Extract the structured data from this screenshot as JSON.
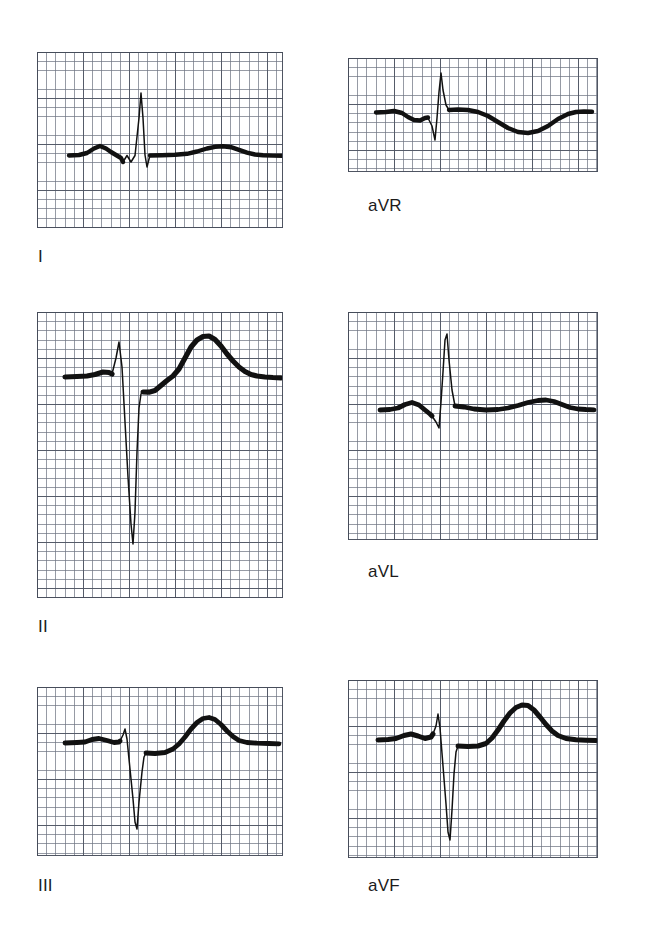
{
  "figure": {
    "kind": "ecg-limb-leads",
    "background_color": "#ffffff",
    "trace_color": "#111111",
    "grid_fine_color": "#6e7482",
    "grid_bold_color": "#505664",
    "width": 667,
    "height": 941
  },
  "panels": [
    {
      "id": "lead-i",
      "label": "I",
      "label_left": 38,
      "label_top": 247,
      "x": 37,
      "y": 52,
      "w": 246,
      "h": 176,
      "baseline_frac": 0.585,
      "grid_mm": 9.2,
      "description": "Lead I: small upright P, narrow tall R wave, small s, low flat ST, broad low T wave"
    },
    {
      "id": "lead-avr",
      "label": "aVR",
      "label_left": 368,
      "label_top": 196,
      "x": 348,
      "y": 58,
      "w": 250,
      "h": 114,
      "baseline_frac": 0.5,
      "grid_mm": 9.2,
      "description": "aVR: notched low P, deep narrow Q/S, tall R spike, broad inverted T wave"
    },
    {
      "id": "lead-ii",
      "label": "II",
      "label_left": 38,
      "label_top": 617,
      "x": 37,
      "y": 312,
      "w": 246,
      "h": 286,
      "baseline_frac": 0.228,
      "grid_mm": 9.2,
      "description": "Lead II: tall peaked P/R, very deep narrow S wave, large broad upright T wave"
    },
    {
      "id": "lead-avl",
      "label": "aVL",
      "label_left": 368,
      "label_top": 562,
      "x": 348,
      "y": 312,
      "w": 250,
      "h": 228,
      "baseline_frac": 0.425,
      "grid_mm": 9.2,
      "description": "aVL: rounded P, small s, tall narrow R spike, flat ST, low broad T wave"
    },
    {
      "id": "lead-iii",
      "label": "III",
      "label_left": 38,
      "label_top": 876,
      "x": 37,
      "y": 687,
      "w": 246,
      "h": 169,
      "baseline_frac": 0.33,
      "grid_mm": 9.2,
      "description": "Lead III: low P, small r spike, deep narrow S wave, broad upright T wave"
    },
    {
      "id": "lead-avf",
      "label": "aVF",
      "label_left": 368,
      "label_top": 876,
      "x": 348,
      "y": 680,
      "w": 250,
      "h": 178,
      "baseline_frac": 0.305,
      "grid_mm": 9.2,
      "description": "aVF: low rounded P, small r, very deep narrow S wave, large broad upright T wave"
    }
  ],
  "waveforms": {
    "lead-i": {
      "viewbox": "0 0 246 176",
      "baseline_y": 103,
      "thin_path": "M 86 110 L 90 103.5 L 94 110 L 98 103.5 L 102 66 L 104 41 L 106 66 L 108 103 L 110 115 L 113 103",
      "thick_path": "M 32 103.5 L 42 103 L 50 101 L 57 96.5 L 63 94 L 69 96.5 L 74 100 L 79 103 L 84 106 L 86 110 M 113 103.5 L 125 103.2 L 138 102.8 L 150 101.8 L 160 99.5 L 170 96.5 L 178 94.8 L 186 94.2 L 194 95.2 L 202 97.8 L 210 100.6 L 218 102.5 L 226 103.3 L 236 103.6 L 245 103.8",
      "thin_width": 1.5,
      "thick_width": 4.4
    },
    "lead-avr": {
      "viewbox": "0 0 250 114",
      "baseline_y": 56,
      "thin_path": "M 80 60 L 84 68 L 87 82 L 89 60 L 91 34 L 93 15 L 95 32 L 98 47 L 101 52",
      "thick_path": "M 28 54.5 L 38 54 L 46 53 L 54 55 L 60 59 L 66 62 L 72 62.5 L 77 60 L 80 59.5 M 101 52 L 110 51.5 L 120 52 L 130 54 L 140 58 L 150 64 L 160 70 L 170 74 L 180 75 L 190 73 L 200 68 L 210 61 L 220 56 L 228 54 L 236 53.5 L 244 53.8",
      "thin_width": 1.5,
      "thick_width": 4.4
    },
    "lead-ii": {
      "viewbox": "0 0 246 286",
      "baseline_y": 65,
      "thin_path": "M 75 62 L 79 46 L 82 30 L 85 55 L 88 110 L 91 165 L 94 212 L 96 232 L 98 200 L 100 140 L 102 96 L 104 82 L 106 80",
      "thick_path": "M 28 65 L 40 64.5 L 50 64 L 58 62.5 L 66 60 L 72 60.5 L 75 62 M 106 80 L 112 80.2 L 118 78.6 L 124 73.5 L 130 68.5 L 136 64 L 142 57 L 148 46 L 154 35 L 160 28 L 166 24.5 L 172 24 L 178 27.5 L 184 34 L 190 42 L 196 49 L 202 55 L 208 59.5 L 214 62.5 L 220 64 L 228 65 L 236 65.5 L 244 65.8",
      "thin_width": 1.5,
      "thick_width": 5.2
    },
    "lead-avl": {
      "viewbox": "0 0 250 228",
      "baseline_y": 97,
      "thin_path": "M 84 104 L 88 110 L 91 116 L 93 90 L 95 60 L 97 28 L 99 22 L 101 48 L 104 78 L 107 94",
      "thick_path": "M 32 98 L 42 97.5 L 50 96 L 57 92.5 L 64 90.5 L 71 93 L 77 98 L 82 102 L 84 104 M 107 94 L 116 95 L 126 97 L 138 98 L 150 97.5 L 160 96 L 170 93.5 L 180 90.5 L 190 88.5 L 198 88 L 206 89.5 L 214 92.5 L 222 95.5 L 230 97 L 238 97.5 L 246 97.8",
      "thin_width": 1.5,
      "thick_width": 4.8
    },
    "lead-iii": {
      "viewbox": "0 0 246 169",
      "baseline_y": 56,
      "thin_path": "M 83 54 L 86 48 L 88 42 L 90 52 L 93 82 L 96 112 L 98 135 L 100 142 L 102 115 L 105 85 L 107 70 L 109 66",
      "thick_path": "M 28 56 L 40 55.5 L 48 55 L 55 52.5 L 62 51.5 L 70 53.5 L 77 55.5 L 82 55 L 83 54 M 109 66 L 118 66.5 L 128 65.5 L 136 62 L 142 57 L 148 50 L 154 42 L 160 35.5 L 166 31.5 L 172 30.5 L 178 32.5 L 184 37.5 L 190 44 L 196 49.5 L 202 53.5 L 210 55.5 L 220 56.2 L 232 56.5 L 242 56.8",
      "thin_width": 1.5,
      "thick_width": 4.8
    },
    "lead-avf": {
      "viewbox": "0 0 250 178",
      "baseline_y": 60,
      "thin_path": "M 85 54 L 88 46 L 90 34 L 92 48 L 95 86 L 98 124 L 100 152 L 102 160 L 104 130 L 106 94 L 108 72 L 110 66",
      "thick_path": "M 30 60 L 40 59.5 L 48 58.5 L 56 55.5 L 63 54 L 70 56 L 77 58.5 L 83 57 L 85 54 M 110 66 L 120 66.5 L 130 66 L 138 63.5 L 144 58 L 150 50 L 156 41 L 162 33 L 168 27.5 L 174 25 L 180 25.5 L 186 30 L 192 37 L 198 44.5 L 204 51 L 210 55.5 L 218 58.5 L 228 59.8 L 238 60.2 L 248 60.5",
      "thin_width": 1.5,
      "thick_width": 5.0
    }
  }
}
